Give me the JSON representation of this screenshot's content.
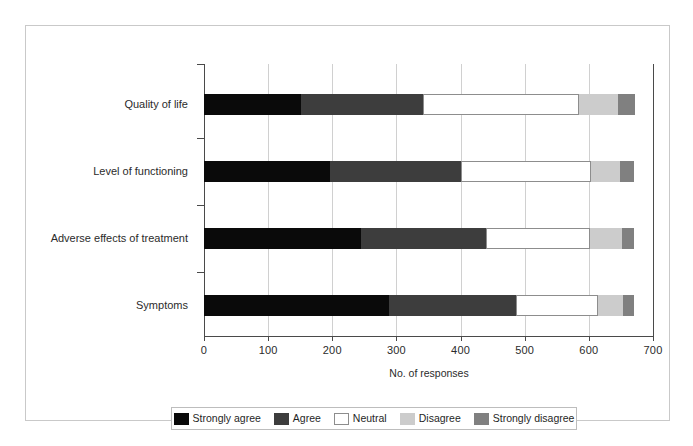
{
  "figure": {
    "background_color": "#ffffff",
    "frame_color": "#c9c9c9"
  },
  "chart_data": {
    "type": "bar",
    "orientation": "horizontal",
    "stacked": true,
    "title": "",
    "xlabel": "No. of responses",
    "ylabel": "",
    "xlim": [
      0,
      700
    ],
    "ylim": [
      0,
      4
    ],
    "grid": true,
    "legend_position": "bottom",
    "xticks": [
      0,
      100,
      200,
      300,
      400,
      500,
      600,
      700
    ],
    "xtick_labels": [
      "0",
      "100",
      "200",
      "300",
      "400",
      "500",
      "600",
      "700"
    ],
    "categories": [
      "Quality of life",
      "Level of functioning",
      "Adverse effects of treatment",
      "Symptoms"
    ],
    "series": [
      {
        "name": "Strongly agree",
        "color": "#0a0a0a",
        "values": [
          152,
          196,
          245,
          289
        ]
      },
      {
        "name": "Agree",
        "color": "#3d3d3d",
        "values": [
          189,
          204,
          194,
          198
        ]
      },
      {
        "name": "Neutral",
        "color": "#ffffff",
        "values": [
          243,
          203,
          163,
          127
        ]
      },
      {
        "name": "Disagree",
        "color": "#cccccc",
        "values": [
          61,
          46,
          49,
          39
        ]
      },
      {
        "name": "Strongly disagree",
        "color": "#808080",
        "values": [
          27,
          21,
          19,
          18
        ]
      }
    ],
    "cumulative_edges": [
      [
        0,
        152,
        341,
        584,
        645,
        672
      ],
      [
        0,
        196,
        400,
        603,
        649,
        670
      ],
      [
        0,
        245,
        439,
        602,
        651,
        670
      ],
      [
        0,
        289,
        487,
        614,
        653,
        671
      ]
    ],
    "totals": [
      672,
      670,
      670,
      671
    ]
  },
  "legend": {
    "items": [
      {
        "label": "Strongly agree",
        "color": "#0a0a0a",
        "outlined": false
      },
      {
        "label": "Agree",
        "color": "#3d3d3d",
        "outlined": false
      },
      {
        "label": "Neutral",
        "color": "#ffffff",
        "outlined": true
      },
      {
        "label": "Disagree",
        "color": "#cccccc",
        "outlined": false
      },
      {
        "label": "Strongly disagree",
        "color": "#808080",
        "outlined": false
      }
    ]
  }
}
